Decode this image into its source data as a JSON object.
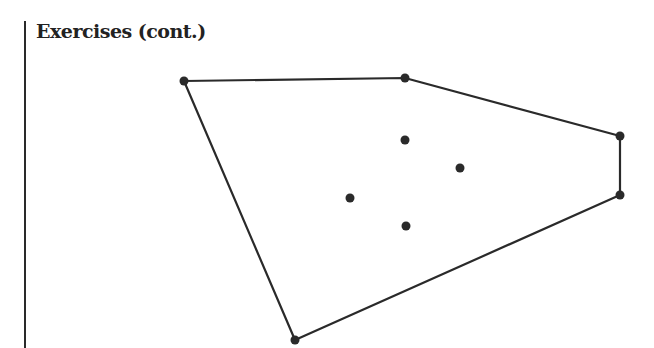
{
  "title": "Exercises (cont.)",
  "diagram": {
    "hull_vertices": [
      [
        184,
        81
      ],
      [
        405,
        78
      ],
      [
        620,
        136
      ],
      [
        620,
        195
      ],
      [
        295,
        340
      ]
    ],
    "interior_points": [
      [
        405,
        140
      ],
      [
        460,
        168
      ],
      [
        350,
        198
      ],
      [
        406,
        226
      ]
    ],
    "stroke_color": "#2a2a2a"
  }
}
